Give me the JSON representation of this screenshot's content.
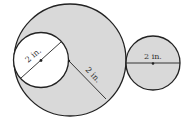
{
  "figure": {
    "large_circle": {
      "fill": "#d9d9d9",
      "label": "2 in.",
      "label_meaning": "radius"
    },
    "inner_circle": {
      "fill": "#ffffff",
      "label": "2 in.",
      "label_meaning": "diameter"
    },
    "right_circle": {
      "fill": "#d9d9d9",
      "label": "2 in.",
      "label_meaning": "diameter"
    },
    "stroke_color": "#222222"
  }
}
